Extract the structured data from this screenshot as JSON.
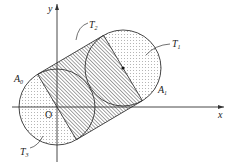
{
  "figure": {
    "type": "geometry-diagram",
    "axes": {
      "x_label": "x",
      "y_label": "y",
      "origin_label": "O"
    },
    "labels": {
      "A0": "A",
      "A0_sub": "0",
      "A1": "A",
      "A1_sub": "1",
      "T1": "T",
      "T1_sub": "1",
      "T2": "T",
      "T2_sub": "2",
      "T3": "T",
      "T3_sub": "3"
    },
    "colors": {
      "stroke": "#333333",
      "dots": "#555555",
      "hatch": "#444444",
      "background": "#ffffff"
    }
  }
}
